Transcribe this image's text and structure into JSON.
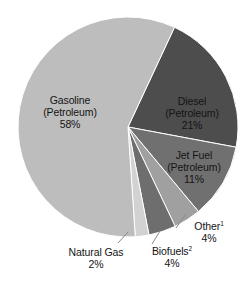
{
  "chart_data": {
    "type": "pie",
    "title": "",
    "subtitle": "",
    "xlabel": "",
    "ylabel": "",
    "legend_position": "none",
    "grid": false,
    "value_unit": "%",
    "total": 100,
    "categories": [
      "Gasoline (Petroleum)",
      "Diesel (Petroleum)",
      "Jet Fuel (Petroleum)",
      "Other",
      "Biofuels",
      "Natural Gas"
    ],
    "values": [
      58,
      21,
      11,
      4,
      4,
      2
    ],
    "slices": [
      {
        "key": "gasoline",
        "name": "Gasoline (Petroleum)",
        "line1": "Gasoline",
        "line2": "(Petroleum)",
        "value": 58,
        "value_text": "58%",
        "color": "#bdbdbd",
        "label_placement": "inside",
        "footnote_marker": ""
      },
      {
        "key": "diesel",
        "name": "Diesel (Petroleum)",
        "line1": "Diesel",
        "line2": "(Petroleum)",
        "value": 21,
        "value_text": "21%",
        "color": "#4d4d4d",
        "label_placement": "inside",
        "footnote_marker": ""
      },
      {
        "key": "jet_fuel",
        "name": "Jet Fuel (Petroleum)",
        "line1": "Jet Fuel",
        "line2": "(Petroleum)",
        "value": 11,
        "value_text": "11%",
        "color": "#707070",
        "label_placement": "inside",
        "footnote_marker": ""
      },
      {
        "key": "other",
        "name": "Other",
        "line1": "Other",
        "line2": "",
        "value": 4,
        "value_text": "4%",
        "color": "#a0a0a0",
        "label_placement": "outside",
        "footnote_marker": "1"
      },
      {
        "key": "biofuels",
        "name": "Biofuels",
        "line1": "Biofuels",
        "line2": "",
        "value": 4,
        "value_text": "4%",
        "color": "#6e6e6e",
        "label_placement": "outside",
        "footnote_marker": "2"
      },
      {
        "key": "natural_gas",
        "name": "Natural Gas",
        "line1": "Natural Gas",
        "line2": "",
        "value": 2,
        "value_text": "2%",
        "color": "#d2d2d2",
        "label_placement": "outside",
        "footnote_marker": ""
      }
    ]
  },
  "colors": {
    "background": "#ffffff",
    "text": "#141414",
    "slice_outline": "#ffffff",
    "leader_line": "#8a8a8a"
  }
}
